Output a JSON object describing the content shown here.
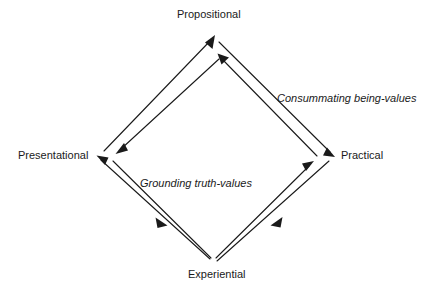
{
  "diagram": {
    "type": "cycle-diamond",
    "line_color": "#1a1a1a",
    "background_color": "#ffffff",
    "vertices": [
      {
        "id": "propositional",
        "label": "Propositional",
        "position": "top"
      },
      {
        "id": "presentational",
        "label": "Presentational",
        "position": "left"
      },
      {
        "id": "practical",
        "label": "Practical",
        "position": "right"
      },
      {
        "id": "experiential",
        "label": "Experiential",
        "position": "bottom"
      }
    ],
    "annotations": [
      {
        "id": "consummating",
        "label": "Consummating being-values",
        "style": "italic",
        "describes": "propositional-to-practical-to-experiential"
      },
      {
        "id": "grounding",
        "label": "Grounding truth-values",
        "style": "italic",
        "describes": "presentational-to-experiential"
      }
    ],
    "edges": [
      {
        "id": "experiential-to-presentational-to-propositional",
        "from": "experiential",
        "to": "propositional",
        "via": "presentational",
        "arrowheads": [
          "presentational",
          "propositional"
        ]
      },
      {
        "id": "propositional-to-practical-to-experiential",
        "from": "propositional",
        "to": "experiential",
        "via": "practical",
        "arrowheads": [
          "practical",
          "experiential"
        ]
      },
      {
        "id": "experiential-to-practical-to-propositional",
        "from": "experiential",
        "to": "propositional",
        "via": "practical",
        "arrowheads": [
          "practical",
          "propositional"
        ]
      },
      {
        "id": "propositional-to-presentational-to-experiential",
        "from": "propositional",
        "to": "experiential",
        "via": "presentational",
        "arrowheads": [
          "presentational",
          "experiential"
        ]
      }
    ]
  }
}
